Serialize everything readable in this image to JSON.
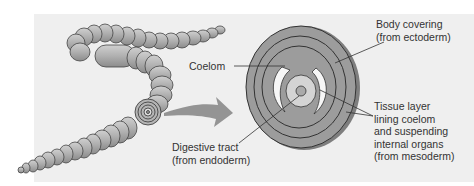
{
  "figure": {
    "type": "biology-diagram",
    "colors": {
      "panel_background": "#efefef",
      "tissue_gray": "#9c9c9c",
      "tissue_dark": "#7e7e7e",
      "inner_light": "#d4d4d4",
      "coelom_space": "#f6f6f6",
      "arrow": "#8a8a8a",
      "text": "#333333",
      "leader_line": "#333333"
    }
  },
  "labels": {
    "coelom": {
      "lines": [
        "Coelom"
      ]
    },
    "body_covering": {
      "lines": [
        "Body covering",
        "(from ectoderm)"
      ]
    },
    "tissue_layer": {
      "lines": [
        "Tissue layer",
        "lining coelom",
        "and suspending",
        "internal organs",
        "(from mesoderm)"
      ]
    },
    "digestive_tract": {
      "lines": [
        "Digestive tract",
        "(from endoderm)"
      ]
    }
  }
}
